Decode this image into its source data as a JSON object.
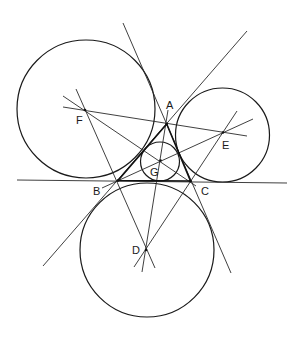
{
  "diagram": {
    "title": "",
    "colors": {
      "stroke": "#1a1a1a",
      "background": "#ffffff"
    },
    "points": [
      {
        "id": "A",
        "label": "A",
        "x": 166.7,
        "y": 124,
        "lx": 166,
        "ly": 109
      },
      {
        "id": "B",
        "label": "B",
        "x": 118,
        "y": 180.5,
        "lx": 93,
        "ly": 195
      },
      {
        "id": "C",
        "label": "C",
        "x": 190.5,
        "y": 181,
        "lx": 201,
        "ly": 195
      },
      {
        "id": "D",
        "label": "D",
        "x": 146,
        "y": 250,
        "lx": 132,
        "ly": 254
      },
      {
        "id": "E",
        "label": "E",
        "x": 223,
        "y": 132.5,
        "lx": 222,
        "ly": 149
      },
      {
        "id": "F",
        "label": "F",
        "x": 85,
        "y": 110,
        "lx": 76,
        "ly": 124
      },
      {
        "id": "G",
        "label": "G",
        "x": 160.5,
        "y": 160.5,
        "lx": 150,
        "ly": 176
      }
    ],
    "circles": [
      {
        "id": "excircle-F",
        "cx": 86,
        "cy": 109,
        "r": 69
      },
      {
        "id": "excircle-E",
        "cx": 222.5,
        "cy": 135,
        "r": 47
      },
      {
        "id": "excircle-D",
        "cx": 147,
        "cy": 250,
        "r": 67
      },
      {
        "id": "incircle-G",
        "cx": 160,
        "cy": 161.5,
        "r": 19.5
      }
    ],
    "lines": [
      {
        "id": "line-BC-extended",
        "x1": 17,
        "y1": 180,
        "x2": 287,
        "y2": 183
      },
      {
        "id": "line-AC-extended",
        "x1": 123,
        "y1": 23,
        "x2": 231,
        "y2": 273
      },
      {
        "id": "line-AB-extended",
        "x1": 247,
        "y1": 31,
        "x2": 43,
        "y2": 266
      },
      {
        "id": "line-F-C",
        "x1": 63,
        "y1": 96,
        "x2": 196,
        "y2": 186
      },
      {
        "id": "line-F-E",
        "x1": 63,
        "y1": 107,
        "x2": 247,
        "y2": 136
      },
      {
        "id": "line-F-D",
        "x1": 76,
        "y1": 89,
        "x2": 155,
        "y2": 268
      },
      {
        "id": "line-B-E",
        "x1": 102,
        "y1": 188,
        "x2": 253,
        "y2": 119
      },
      {
        "id": "line-D-E",
        "x1": 134,
        "y1": 267,
        "x2": 237,
        "y2": 111
      },
      {
        "id": "line-A-D",
        "x1": 168,
        "y1": 110,
        "x2": 142,
        "y2": 272
      }
    ],
    "triangle": {
      "id": "triangle-ABC",
      "points": "166.7,124 118,180.5 190.5,181"
    }
  }
}
